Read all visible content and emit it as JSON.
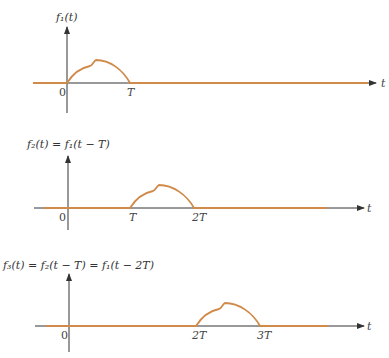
{
  "colors": {
    "axis": "#333333",
    "signal": "#d08a4a"
  },
  "axis_label": "t",
  "plots": [
    {
      "title": "f₁(t)",
      "ticks": [
        {
          "label": "0"
        },
        {
          "label": "T"
        }
      ],
      "pulse_start": "0",
      "pulse_end": "T"
    },
    {
      "title": "f₂(t) = f₁(t − T)",
      "ticks": [
        {
          "label": "0"
        },
        {
          "label": "T"
        },
        {
          "label": "2T"
        }
      ],
      "pulse_start": "T",
      "pulse_end": "2T"
    },
    {
      "title": "f₃(t) = f₂(t − T) = f₁(t − 2T)",
      "ticks": [
        {
          "label": "0"
        },
        {
          "label": "2T"
        },
        {
          "label": "3T"
        }
      ],
      "pulse_start": "2T",
      "pulse_end": "3T"
    }
  ]
}
